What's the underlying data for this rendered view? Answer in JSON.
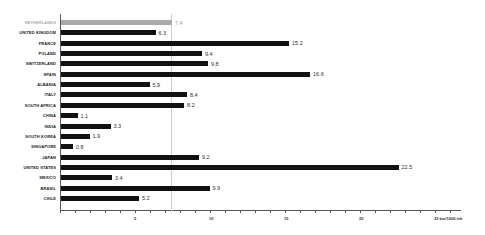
{
  "chart_data": {
    "type": "bar",
    "orientation": "horizontal",
    "title": "",
    "xlabel": "km/1000 inh",
    "ylabel": "",
    "xlim": [
      0,
      26.7
    ],
    "grid": false,
    "reference_line": {
      "value": 7.4,
      "color": "#cccccc"
    },
    "categories": [
      "NETHERLANDS",
      "UNITED KINGDOM",
      "FRANCE",
      "POLAND",
      "SWITZERLAND",
      "SPAIN",
      "ALBANIA",
      "ITALY",
      "SOUTH AFRICA",
      "CHINA",
      "INDIA",
      "SOUTH KOREA",
      "SINGAPORE",
      "JAPAN",
      "UNITED STATES",
      "MEXICO",
      "BRASIL",
      "CHILE"
    ],
    "values": [
      7.4,
      6.3,
      15.2,
      9.4,
      9.8,
      16.6,
      5.9,
      8.4,
      8.2,
      1.1,
      3.3,
      1.9,
      0.8,
      9.2,
      22.5,
      3.4,
      9.9,
      5.2
    ],
    "value_labels": [
      "7.4",
      "6.3",
      "15.2",
      "9.4",
      "9.8",
      "16.6",
      "5.9",
      "8.4",
      "8.2",
      "1.1",
      "3.3",
      "1.9",
      "0.8",
      "9.2",
      "22.5",
      "3.4",
      "9.9",
      "5.2"
    ],
    "highlight": {
      "category": "NETHERLANDS",
      "color": "#aaaaaa"
    },
    "bar_color": "#111111",
    "x_ticks": [
      {
        "value": 5,
        "label": "5"
      },
      {
        "value": 10,
        "label": "10"
      },
      {
        "value": 15,
        "label": "15"
      },
      {
        "value": 20,
        "label": "20"
      },
      {
        "value": 25,
        "label": "25 km/1000 inh"
      }
    ]
  }
}
